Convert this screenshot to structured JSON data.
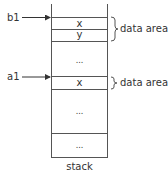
{
  "diagram": {
    "type": "stack-memory-layout",
    "caption": "stack",
    "cells": [
      {
        "label": "x"
      },
      {
        "label": "y"
      },
      {
        "label": "..."
      },
      {
        "label": "x"
      },
      {
        "label": "..."
      },
      {
        "label": "..."
      }
    ],
    "pointers": [
      {
        "label": "b1",
        "points_to_cell": 0
      },
      {
        "label": "a1",
        "points_to_cell": 3
      }
    ],
    "braces": [
      {
        "label": "data area",
        "spans_cells": [
          0,
          1
        ]
      },
      {
        "label": "data area",
        "spans_cells": [
          3
        ]
      }
    ],
    "colors": {
      "line": "#333333",
      "text": "#333333",
      "background": "#ffffff"
    }
  }
}
